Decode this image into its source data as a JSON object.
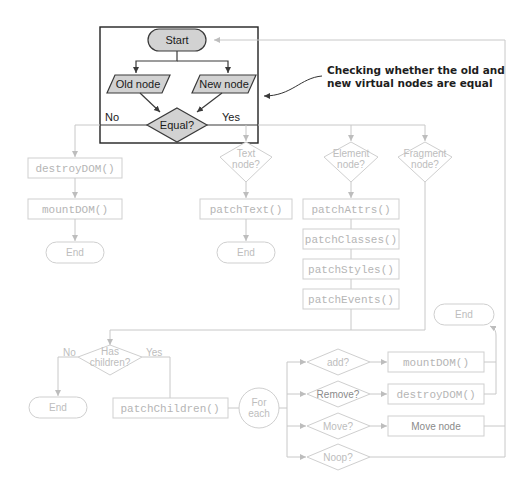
{
  "annotation": {
    "line1": "Checking whether the old and",
    "line2": "new virtual nodes are equal"
  },
  "main_block": {
    "start": "Start",
    "old_node": "Old node",
    "new_node": "New node",
    "equal": "Equal?",
    "no": "No",
    "yes": "Yes"
  },
  "no_branch": {
    "destroy": "destroyDOM()",
    "mount": "mountDOM()",
    "end": "End"
  },
  "text_branch": {
    "decision_l1": "Text",
    "decision_l2": "node?",
    "patch": "patchText()",
    "end": "End"
  },
  "element_branch": {
    "decision_l1": "Element",
    "decision_l2": "node?",
    "steps": [
      "patchAttrs()",
      "patchClasses()",
      "patchStyles()",
      "patchEvents()"
    ]
  },
  "fragment_branch": {
    "decision_l1": "Fragment",
    "decision_l2": "node?"
  },
  "children": {
    "decision_l1": "Has",
    "decision_l2": "children?",
    "no": "No",
    "yes": "Yes",
    "end": "End",
    "patch": "patchChildren()",
    "loop_l1": "For",
    "loop_l2": "each"
  },
  "operations": {
    "add": "add?",
    "remove": "Remove?",
    "move": "Move?",
    "noop": "Noop?",
    "mount": "mountDOM()",
    "destroy": "destroyDOM()",
    "move_node": "Move node",
    "end": "End"
  }
}
